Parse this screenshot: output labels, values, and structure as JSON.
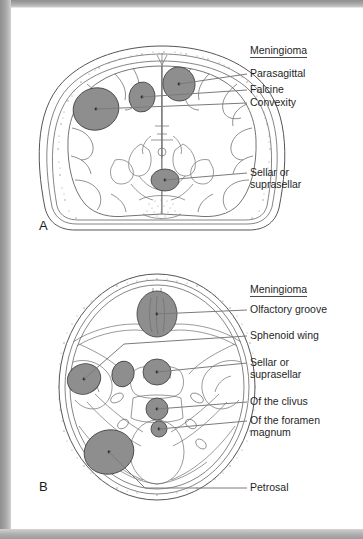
{
  "figure": {
    "caption_letters": {
      "panel_a": "A",
      "panel_b": "B"
    },
    "colors": {
      "tumor_fill": "#8e8e8e",
      "tumor_stroke": "#4a4a4a",
      "outline": "#5a5a5a",
      "leader_line": "#7b7b7b",
      "frame": "#9a9a9a",
      "background": "#ffffff",
      "text": "#1f1f1f"
    }
  },
  "panel_a": {
    "letter": "A",
    "view": "coronal-brain-section",
    "legend": {
      "title": "Meningioma",
      "items": [
        {
          "label": "Parasagittal",
          "target": "parasagittal-tumor"
        },
        {
          "label": "Falcine",
          "target": "falcine-tumor"
        },
        {
          "label": "Convexity",
          "target": "convexity-tumor"
        },
        {
          "label": "Sellar or\nsuprasellar",
          "target": "sellar-suprasellar-tumor"
        }
      ]
    },
    "tumors": [
      {
        "name": "parasagittal-tumor"
      },
      {
        "name": "falcine-tumor"
      },
      {
        "name": "convexity-tumor"
      },
      {
        "name": "sellar-suprasellar-tumor"
      }
    ]
  },
  "panel_b": {
    "letter": "B",
    "view": "axial-skull-base-section",
    "legend": {
      "title": "Meningioma",
      "items": [
        {
          "label": "Olfactory groove",
          "target": "olfactory-groove-tumor"
        },
        {
          "label": "Sphenoid wing",
          "target": "sphenoid-wing-tumor"
        },
        {
          "label": "Sellar or\nsuprasellar",
          "target": "sellar-suprasellar-tumor"
        },
        {
          "label": "Of the clivus",
          "target": "clivus-tumor"
        },
        {
          "label": "Of the foramen\nmagnum",
          "target": "foramen-magnum-tumor"
        },
        {
          "label": "Petrosal",
          "target": "petrosal-tumor"
        }
      ]
    },
    "tumors": [
      {
        "name": "olfactory-groove-tumor"
      },
      {
        "name": "sphenoid-wing-tumor-left"
      },
      {
        "name": "sphenoid-wing-tumor-right"
      },
      {
        "name": "sellar-suprasellar-tumor"
      },
      {
        "name": "clivus-tumor"
      },
      {
        "name": "foramen-magnum-tumor"
      },
      {
        "name": "petrosal-tumor"
      }
    ]
  }
}
